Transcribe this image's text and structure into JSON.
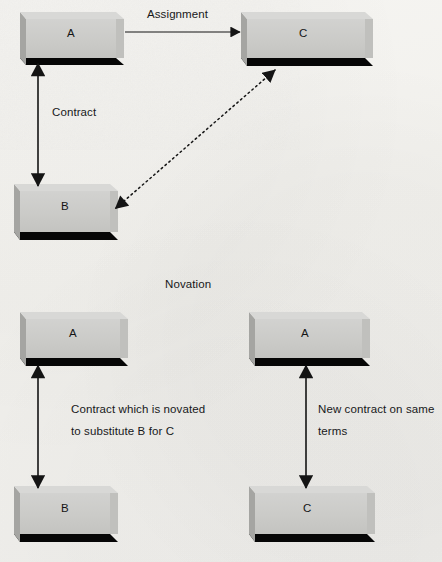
{
  "page": {
    "background_color": "#f3f2ef",
    "width": 442,
    "height": 562
  },
  "style": {
    "box_face_color": "#cbcbc9",
    "box_bevel_color": "#a9a9a6",
    "box_shadow_color": "#000000",
    "line_color": "#1a1a1a",
    "text_color": "#17181a"
  },
  "diagram": {
    "type": "relationship-diagram",
    "sections": [
      {
        "id": "assignment",
        "heading": "",
        "nodes": [
          {
            "id": "top-a",
            "label": "A"
          },
          {
            "id": "top-c",
            "label": "C"
          },
          {
            "id": "top-b",
            "label": "B"
          }
        ],
        "edges": [
          {
            "id": "a-to-c",
            "label": "Assignment",
            "from": "top-a",
            "to": "top-c",
            "style": "solid",
            "heads": "single"
          },
          {
            "id": "a-to-b",
            "label": "Contract",
            "from": "top-a",
            "to": "top-b",
            "style": "solid",
            "heads": "double"
          },
          {
            "id": "b-to-c",
            "label": "",
            "from": "top-b",
            "to": "top-c",
            "style": "dotted",
            "heads": "double"
          }
        ]
      },
      {
        "id": "novation",
        "heading": "Novation",
        "nodes": [
          {
            "id": "nov-left-a",
            "label": "A"
          },
          {
            "id": "nov-left-b",
            "label": "B"
          },
          {
            "id": "nov-right-a",
            "label": "A"
          },
          {
            "id": "nov-right-c",
            "label": "C"
          }
        ],
        "edges": [
          {
            "id": "nov-left-edge",
            "label": "Contract which is novated\nto substitute B for C",
            "from": "nov-left-a",
            "to": "nov-left-b",
            "style": "solid",
            "heads": "double"
          },
          {
            "id": "nov-right-edge",
            "label": "New contract on same\nterms",
            "from": "nov-right-a",
            "to": "nov-right-c",
            "style": "solid",
            "heads": "double"
          }
        ]
      }
    ]
  },
  "labels": {
    "assignment": "Assignment",
    "contract": "Contract",
    "novation": "Novation",
    "novated_line1": "Contract which is novated",
    "novated_line2": "to substitute B for C",
    "newcontract_line1": "New contract on same",
    "newcontract_line2": "terms"
  },
  "boxes": {
    "top_a": "A",
    "top_c": "C",
    "top_b": "B",
    "nov_left_a": "A",
    "nov_left_b": "B",
    "nov_right_a": "A",
    "nov_right_c": "C"
  }
}
